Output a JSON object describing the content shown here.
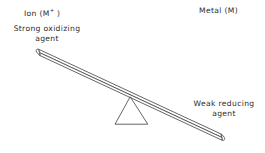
{
  "figure": {
    "type": "balance-seesaw-diagram",
    "background_color": "#ffffff",
    "stroke_color": "#4a4a4a",
    "text_color": "#2b2b2b"
  },
  "labels": {
    "ion": {
      "text_before": "Ion (M",
      "superscript": "+",
      "text_after": " )"
    },
    "metal": "Metal  (M)"
  },
  "captions": {
    "left": {
      "line1": "Strong  oxidizing",
      "line2": "agent"
    },
    "right": {
      "line1": "Weak  reducing",
      "line2": "agent"
    }
  },
  "geometry": {
    "beam": {
      "left_tip_x": 38,
      "left_tip_y": 49,
      "right_tip_x": 222,
      "right_tip_y": 138,
      "thickness": 5,
      "tilt": "down-to-the-right"
    },
    "fulcrum": {
      "apex_x": 130,
      "apex_y": 97,
      "base_left_x": 115,
      "base_right_x": 148,
      "base_y": 124,
      "shape": "open-triangle"
    }
  }
}
